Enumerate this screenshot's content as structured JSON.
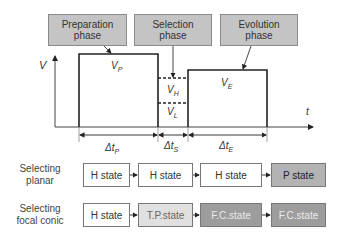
{
  "phases": {
    "preparation": "Preparation\nphase",
    "selection": "Selection\nphase",
    "evolution": "Evolution\nphase"
  },
  "axes": {
    "y_label": "V",
    "x_label": "t"
  },
  "voltages": {
    "vp": {
      "base": "V",
      "sub": "P"
    },
    "vh": {
      "base": "V",
      "sub": "H"
    },
    "vl": {
      "base": "V",
      "sub": "L"
    },
    "ve": {
      "base": "V",
      "sub": "E"
    }
  },
  "durations": {
    "dtp": {
      "base": "Δt",
      "sub": "P"
    },
    "dts": {
      "base": "Δt",
      "sub": "S"
    },
    "dte": {
      "base": "Δt",
      "sub": "E"
    }
  },
  "rows": [
    {
      "label": "Selecting\nplanar",
      "states": [
        "H state",
        "H state",
        "H state",
        "P state"
      ]
    },
    {
      "label": "Selecting\nfocal conic",
      "states": [
        "H state",
        "T.P.state",
        "F.C.state",
        "F.C.state"
      ]
    }
  ],
  "colors": {
    "phase_box": "#c4c4c4",
    "h_state": "#ffffff",
    "p_state": "#b3b3b3",
    "tp_state": "#e0e0e0",
    "fc_state": "#9d9d9d"
  }
}
